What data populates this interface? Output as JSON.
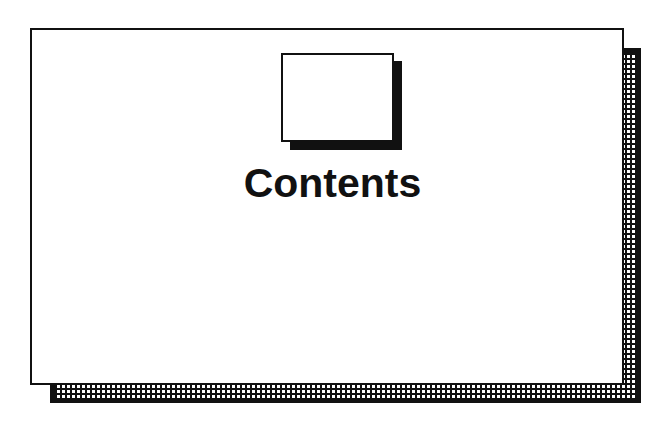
{
  "page": {
    "title": "Contents",
    "colors": {
      "ink": "#111111",
      "paper": "#ffffff"
    },
    "decorations": {
      "page_shadow_pattern": "grid-hatch",
      "icon": "blank-page-icon"
    }
  }
}
